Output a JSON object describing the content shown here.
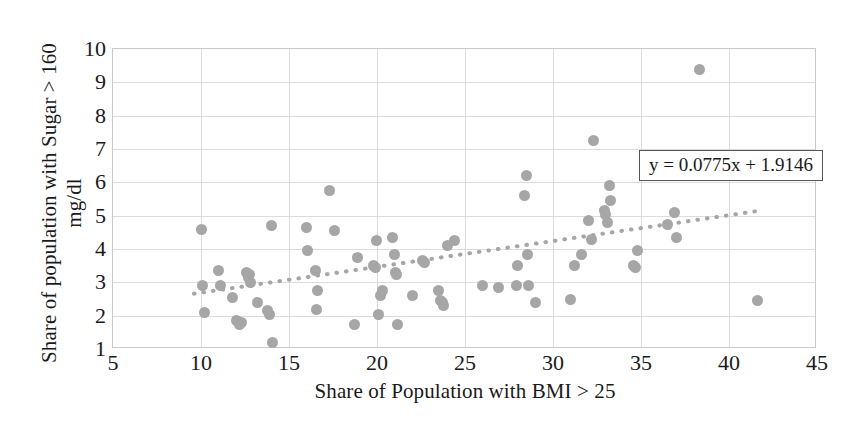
{
  "chart_data": {
    "type": "scatter",
    "title": "",
    "xlabel": "Share of Population with BMI > 25",
    "ylabel": "Share of population with Sugar > 160\nmg/dl",
    "xlim": [
      5,
      45
    ],
    "ylim": [
      1,
      10
    ],
    "xticks": [
      5,
      10,
      15,
      20,
      25,
      30,
      35,
      40,
      45
    ],
    "yticks": [
      1,
      2,
      3,
      4,
      5,
      6,
      7,
      8,
      9,
      10
    ],
    "grid": true,
    "legend": "none",
    "marker_color": "#a6a6a6",
    "trendline": {
      "style": "dotted",
      "color": "#a6a6a6",
      "slope": 0.0775,
      "intercept": 1.9146,
      "equation_label": "y = 0.0775x + 1.9146",
      "x_start": 9.6,
      "x_end": 41.8
    },
    "points": [
      [
        10.0,
        4.6
      ],
      [
        10.1,
        2.9
      ],
      [
        10.2,
        2.1
      ],
      [
        11.0,
        3.35
      ],
      [
        11.1,
        2.9
      ],
      [
        11.8,
        2.55
      ],
      [
        12.0,
        1.85
      ],
      [
        12.3,
        1.8
      ],
      [
        12.2,
        1.75
      ],
      [
        12.6,
        3.3
      ],
      [
        12.7,
        3.15
      ],
      [
        12.75,
        3.25
      ],
      [
        12.8,
        3.0
      ],
      [
        13.2,
        2.4
      ],
      [
        13.8,
        2.15
      ],
      [
        13.9,
        2.05
      ],
      [
        14.0,
        4.7
      ],
      [
        14.05,
        1.2
      ],
      [
        16.0,
        4.65
      ],
      [
        16.05,
        3.95
      ],
      [
        16.5,
        3.35
      ],
      [
        16.6,
        2.75
      ],
      [
        16.55,
        2.2
      ],
      [
        17.3,
        5.75
      ],
      [
        17.6,
        4.55
      ],
      [
        18.7,
        1.75
      ],
      [
        18.9,
        3.75
      ],
      [
        19.8,
        3.5
      ],
      [
        19.9,
        3.45
      ],
      [
        19.95,
        4.25
      ],
      [
        20.1,
        2.05
      ],
      [
        20.2,
        2.6
      ],
      [
        20.3,
        2.75
      ],
      [
        20.9,
        4.35
      ],
      [
        21.0,
        3.85
      ],
      [
        21.05,
        3.3
      ],
      [
        21.1,
        3.25
      ],
      [
        21.15,
        1.75
      ],
      [
        22.0,
        2.6
      ],
      [
        22.6,
        3.65
      ],
      [
        22.7,
        3.6
      ],
      [
        23.5,
        2.75
      ],
      [
        23.6,
        2.45
      ],
      [
        23.7,
        2.4
      ],
      [
        23.8,
        2.3
      ],
      [
        24.0,
        4.1
      ],
      [
        24.4,
        4.25
      ],
      [
        26.0,
        2.9
      ],
      [
        26.9,
        2.85
      ],
      [
        27.9,
        2.9
      ],
      [
        28.0,
        3.5
      ],
      [
        28.6,
        2.9
      ],
      [
        28.5,
        6.2
      ],
      [
        28.4,
        5.6
      ],
      [
        28.55,
        3.85
      ],
      [
        29.0,
        2.4
      ],
      [
        31.0,
        2.5
      ],
      [
        31.2,
        3.5
      ],
      [
        31.6,
        3.85
      ],
      [
        32.0,
        4.85
      ],
      [
        32.2,
        4.3
      ],
      [
        32.3,
        7.25
      ],
      [
        32.9,
        5.15
      ],
      [
        33.0,
        5.05
      ],
      [
        33.1,
        4.8
      ],
      [
        33.2,
        5.9
      ],
      [
        33.25,
        5.45
      ],
      [
        34.6,
        3.5
      ],
      [
        34.7,
        3.45
      ],
      [
        34.8,
        3.95
      ],
      [
        36.5,
        4.75
      ],
      [
        36.9,
        5.1
      ],
      [
        37.0,
        4.35
      ],
      [
        38.3,
        9.4
      ],
      [
        41.6,
        2.45
      ]
    ]
  }
}
